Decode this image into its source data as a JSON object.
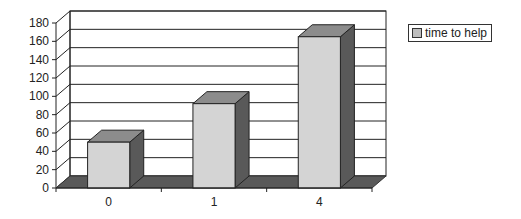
{
  "chart_data": {
    "type": "bar",
    "style": "3d-column",
    "title": "",
    "xlabel": "",
    "ylabel": "",
    "categories": [
      "0",
      "1",
      "4"
    ],
    "series": [
      {
        "name": "time to help",
        "values": [
          50,
          92,
          165
        ]
      }
    ],
    "ylim": [
      0,
      180
    ],
    "yticks": [
      0,
      20,
      40,
      60,
      80,
      100,
      120,
      140,
      160,
      180
    ],
    "grid": true,
    "legend_position": "right-top",
    "colors": {
      "bar_front": "#d4d4d4",
      "bar_top": "#8c8c8c",
      "bar_side": "#595959",
      "floor": "#595959"
    }
  },
  "legend": {
    "label": "time to help"
  }
}
